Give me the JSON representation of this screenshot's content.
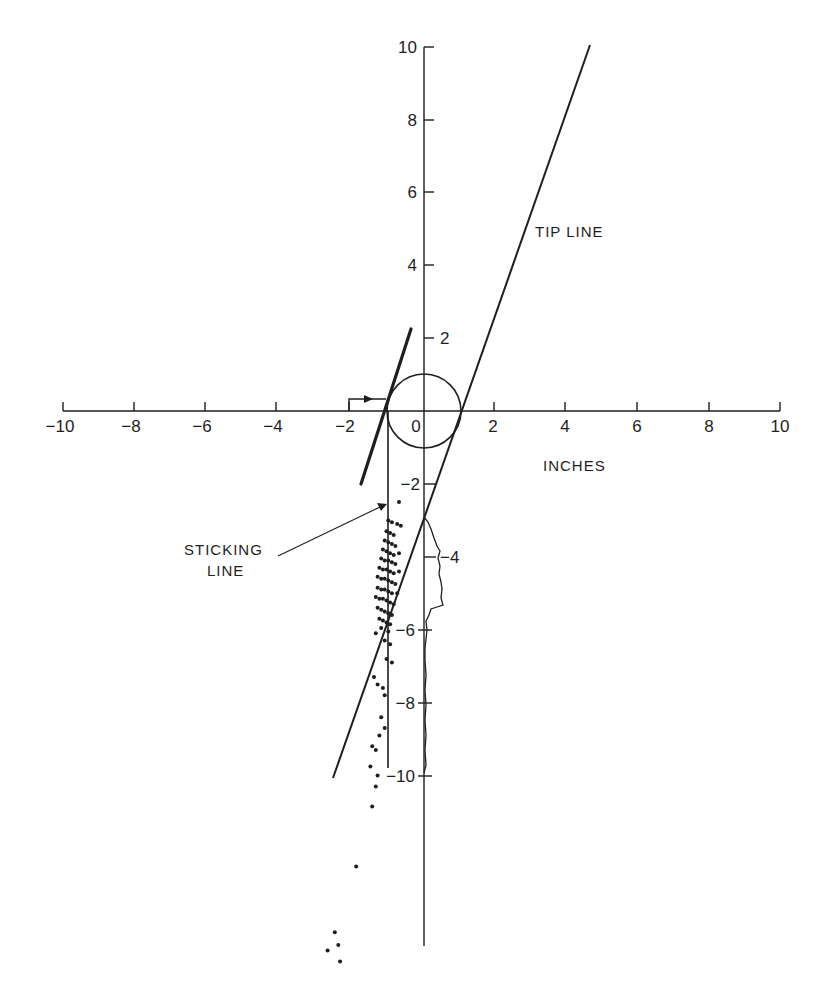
{
  "chart_data": {
    "type": "scatter",
    "title": "",
    "xlabel": "INCHES",
    "ylabel": "",
    "xlim": [
      -10,
      10
    ],
    "ylim": [
      -15,
      10
    ],
    "grid": false,
    "legend": "none",
    "x_ticks": [
      -10,
      -8,
      -6,
      -4,
      -2,
      0,
      2,
      4,
      6,
      8,
      10
    ],
    "x_tick_labels": [
      "−10",
      "−8",
      "−6",
      "−4",
      "−2",
      "0",
      "2",
      "4",
      "6",
      "8",
      "10"
    ],
    "y_ticks": [
      10,
      8,
      6,
      4,
      2,
      -2,
      -4,
      -6,
      -8,
      -10
    ],
    "y_tick_labels": [
      "10",
      "8",
      "6",
      "4",
      "2",
      "−2",
      "−4",
      "−6",
      "−8",
      "−10"
    ],
    "annotations": [
      {
        "id": "tip_line",
        "text": "TIP LINE",
        "x": 3.1,
        "y": 4.8
      },
      {
        "id": "sticking_line",
        "text": [
          "STICKING",
          "LINE"
        ],
        "x": -5.8,
        "y": -3.6,
        "arrow_to": [
          -1.0,
          -2.6
        ]
      },
      {
        "id": "x_unit",
        "text": "INCHES",
        "x": 5.6,
        "y": -1.6
      }
    ],
    "lines": [
      {
        "name": "TIP LINE",
        "from": [
          -2.5,
          -10.1
        ],
        "to": [
          4.7,
          10.0
        ],
        "weight": "normal"
      },
      {
        "name": "STICKING LINE",
        "from": [
          -1.0,
          0.0
        ],
        "to": [
          -1.0,
          -9.8
        ],
        "weight": "normal"
      },
      {
        "name": "thick reference line",
        "from": [
          -1.75,
          -2.0
        ],
        "to": [
          -0.35,
          2.25
        ],
        "weight": "bold"
      },
      {
        "name": "offset arrow",
        "path": [
          [
            -2.1,
            0.0
          ],
          [
            -2.1,
            0.35
          ],
          [
            -1.0,
            0.35
          ]
        ],
        "arrowhead": true
      }
    ],
    "circle": {
      "center": [
        0,
        0
      ],
      "radius": 1.0
    },
    "histogram_outline": {
      "along": "y-axis",
      "baseline_x": 0,
      "profile": [
        {
          "y": -2.9,
          "x": 0.0
        },
        {
          "y": -3.2,
          "x": 0.2
        },
        {
          "y": -3.6,
          "x": 0.3
        },
        {
          "y": -4.0,
          "x": 0.45
        },
        {
          "y": -4.4,
          "x": 0.4
        },
        {
          "y": -4.8,
          "x": 0.45
        },
        {
          "y": -5.1,
          "x": 0.5
        },
        {
          "y": -5.3,
          "x": 0.2
        },
        {
          "y": -5.6,
          "x": 0.15
        },
        {
          "y": -6.0,
          "x": 0.05
        },
        {
          "y": -6.5,
          "x": 0.03
        },
        {
          "y": -7.5,
          "x": 0.02
        },
        {
          "y": -9.0,
          "x": 0.02
        },
        {
          "y": -9.9,
          "x": 0.0
        }
      ]
    },
    "points": [
      {
        "x": -0.7,
        "y": -2.5
      },
      {
        "x": -1.0,
        "y": -3.0
      },
      {
        "x": -0.9,
        "y": -3.05
      },
      {
        "x": -0.75,
        "y": -3.1
      },
      {
        "x": -0.65,
        "y": -3.15
      },
      {
        "x": -1.05,
        "y": -3.3
      },
      {
        "x": -0.95,
        "y": -3.35
      },
      {
        "x": -0.85,
        "y": -3.4
      },
      {
        "x": -1.1,
        "y": -3.55
      },
      {
        "x": -1.0,
        "y": -3.6
      },
      {
        "x": -0.9,
        "y": -3.65
      },
      {
        "x": -0.8,
        "y": -3.7
      },
      {
        "x": -1.15,
        "y": -3.8
      },
      {
        "x": -1.05,
        "y": -3.85
      },
      {
        "x": -0.95,
        "y": -3.9
      },
      {
        "x": -0.85,
        "y": -3.95
      },
      {
        "x": -0.7,
        "y": -3.9
      },
      {
        "x": -1.2,
        "y": -4.05
      },
      {
        "x": -1.1,
        "y": -4.1
      },
      {
        "x": -1.0,
        "y": -4.1
      },
      {
        "x": -0.9,
        "y": -4.15
      },
      {
        "x": -0.8,
        "y": -4.2
      },
      {
        "x": -1.25,
        "y": -4.3
      },
      {
        "x": -1.15,
        "y": -4.35
      },
      {
        "x": -1.05,
        "y": -4.35
      },
      {
        "x": -0.95,
        "y": -4.4
      },
      {
        "x": -0.85,
        "y": -4.45
      },
      {
        "x": -0.7,
        "y": -4.4
      },
      {
        "x": -1.3,
        "y": -4.55
      },
      {
        "x": -1.2,
        "y": -4.6
      },
      {
        "x": -1.1,
        "y": -4.6
      },
      {
        "x": -1.0,
        "y": -4.65
      },
      {
        "x": -0.9,
        "y": -4.7
      },
      {
        "x": -0.8,
        "y": -4.75
      },
      {
        "x": -1.3,
        "y": -4.85
      },
      {
        "x": -1.2,
        "y": -4.9
      },
      {
        "x": -1.1,
        "y": -4.9
      },
      {
        "x": -1.0,
        "y": -4.95
      },
      {
        "x": -0.9,
        "y": -5.0
      },
      {
        "x": -0.75,
        "y": -5.0
      },
      {
        "x": -1.35,
        "y": -5.1
      },
      {
        "x": -1.25,
        "y": -5.15
      },
      {
        "x": -1.15,
        "y": -5.15
      },
      {
        "x": -1.05,
        "y": -5.2
      },
      {
        "x": -0.95,
        "y": -5.25
      },
      {
        "x": -0.85,
        "y": -5.3
      },
      {
        "x": -1.3,
        "y": -5.4
      },
      {
        "x": -1.2,
        "y": -5.45
      },
      {
        "x": -1.1,
        "y": -5.5
      },
      {
        "x": -1.0,
        "y": -5.55
      },
      {
        "x": -0.9,
        "y": -5.6
      },
      {
        "x": -1.25,
        "y": -5.7
      },
      {
        "x": -1.15,
        "y": -5.75
      },
      {
        "x": -1.05,
        "y": -5.8
      },
      {
        "x": -0.95,
        "y": -5.85
      },
      {
        "x": -1.2,
        "y": -5.95
      },
      {
        "x": -1.0,
        "y": -6.05
      },
      {
        "x": -1.35,
        "y": -6.1
      },
      {
        "x": -1.1,
        "y": -6.3
      },
      {
        "x": -0.95,
        "y": -6.4
      },
      {
        "x": -1.05,
        "y": -6.8
      },
      {
        "x": -0.9,
        "y": -6.9
      },
      {
        "x": -1.4,
        "y": -7.3
      },
      {
        "x": -1.3,
        "y": -7.5
      },
      {
        "x": -1.15,
        "y": -7.6
      },
      {
        "x": -1.1,
        "y": -7.8
      },
      {
        "x": -1.2,
        "y": -8.4
      },
      {
        "x": -1.1,
        "y": -8.7
      },
      {
        "x": -1.25,
        "y": -8.9
      },
      {
        "x": -1.45,
        "y": -9.2
      },
      {
        "x": -1.35,
        "y": -9.3
      },
      {
        "x": -1.5,
        "y": -9.75
      },
      {
        "x": -1.3,
        "y": -10.0
      },
      {
        "x": -1.35,
        "y": -10.3
      },
      {
        "x": -1.45,
        "y": -10.85
      },
      {
        "x": -1.9,
        "y": -12.5
      },
      {
        "x": -2.5,
        "y": -14.3
      },
      {
        "x": -2.4,
        "y": -14.65
      },
      {
        "x": -2.7,
        "y": -14.8
      },
      {
        "x": -2.35,
        "y": -15.1
      }
    ]
  },
  "labels": {
    "tip_line": "TIP LINE",
    "sticking_line_1": "STICKING",
    "sticking_line_2": "LINE",
    "inches": "INCHES",
    "x_ticks": [
      "−10",
      "−8",
      "−6",
      "−4",
      "−2",
      "0",
      "2",
      "4",
      "6",
      "8",
      "10"
    ],
    "y_ticks": {
      "p10": "10",
      "p8": "8",
      "p6": "6",
      "p4": "4",
      "p2": "2",
      "m2": "−2",
      "m4": "−4",
      "m6": "−6",
      "m8": "−8",
      "m10": "−10"
    }
  },
  "colors": {
    "ink": "#1e1e1e",
    "background": "#ffffff"
  }
}
